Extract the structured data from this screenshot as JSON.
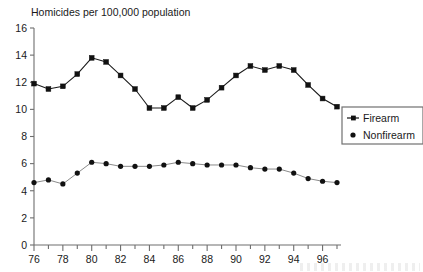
{
  "chart_data": {
    "type": "line",
    "title": "Homicides per 100,000 population",
    "xlabel": "",
    "ylabel": "",
    "xlim": [
      76,
      97
    ],
    "ylim": [
      0,
      16
    ],
    "ytick_step": 2,
    "yticks": [
      0,
      2,
      4,
      6,
      8,
      10,
      12,
      14,
      16
    ],
    "xticks_major": [
      76,
      78,
      80,
      82,
      84,
      86,
      88,
      90,
      92,
      94,
      96
    ],
    "xticks_minor_step": 1,
    "grid": false,
    "legend_position": "right-middle",
    "x": [
      76,
      77,
      78,
      79,
      80,
      81,
      82,
      83,
      84,
      85,
      86,
      87,
      88,
      89,
      90,
      91,
      92,
      93,
      94,
      95,
      96,
      97
    ],
    "series": [
      {
        "name": "Firearm",
        "marker": "square",
        "values": [
          11.9,
          11.5,
          11.7,
          12.6,
          13.8,
          13.5,
          12.5,
          11.5,
          10.1,
          10.1,
          10.9,
          10.1,
          10.7,
          11.6,
          12.5,
          13.2,
          12.9,
          13.2,
          12.9,
          11.8,
          10.8,
          10.2
        ]
      },
      {
        "name": "Nonfirearm",
        "marker": "circle",
        "values": [
          4.6,
          4.8,
          4.5,
          5.3,
          6.1,
          6.0,
          5.8,
          5.8,
          5.8,
          5.9,
          6.1,
          6.0,
          5.9,
          5.9,
          5.9,
          5.7,
          5.6,
          5.6,
          5.3,
          4.9,
          4.7,
          4.6
        ]
      }
    ],
    "legend": [
      "Firearm",
      "Nonfirearm"
    ]
  },
  "colors": {
    "series_line": "#1a1a1a",
    "axis": "#6e6e6e",
    "background": "#ffffff",
    "text": "#1a1a1a"
  },
  "icons": {
    "firearm_marker": "square-marker-icon",
    "nonfirearm_marker": "dot-marker-icon"
  }
}
